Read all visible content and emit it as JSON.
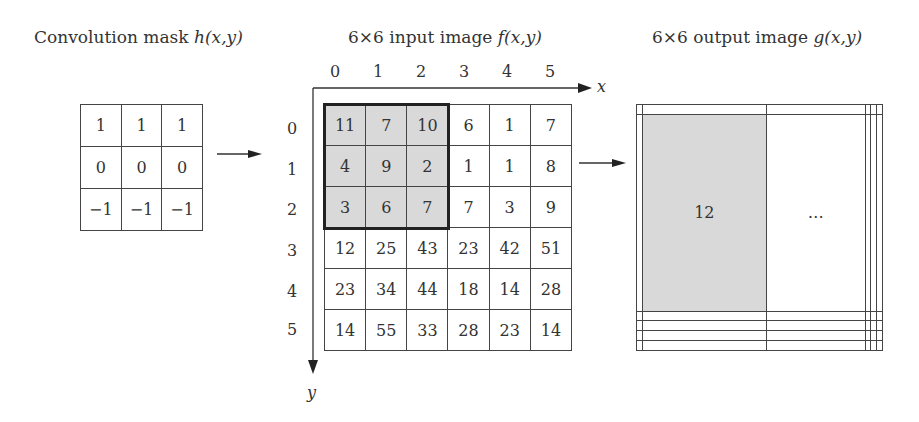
{
  "titles": {
    "mask": {
      "prefix": "Convolution mask ",
      "func": "h",
      "args": "(x,y)"
    },
    "input": {
      "prefix": "6×6 input image ",
      "func": "f",
      "args": "(x,y)"
    },
    "output": {
      "prefix": "6×6 output image ",
      "func": "g",
      "args": "(x,y)"
    }
  },
  "mask": {
    "rows": [
      [
        "1",
        "1",
        "1"
      ],
      [
        "0",
        "0",
        "0"
      ],
      [
        "−1",
        "−1",
        "−1"
      ]
    ]
  },
  "input": {
    "x_ticks": [
      "0",
      "1",
      "2",
      "3",
      "4",
      "5"
    ],
    "y_ticks": [
      "0",
      "1",
      "2",
      "3",
      "4",
      "5"
    ],
    "x_axis_label": "x",
    "y_axis_label": "y",
    "rows": [
      [
        "11",
        "7",
        "10",
        "6",
        "1",
        "7"
      ],
      [
        "4",
        "9",
        "2",
        "1",
        "1",
        "8"
      ],
      [
        "3",
        "6",
        "7",
        "7",
        "3",
        "9"
      ],
      [
        "12",
        "25",
        "43",
        "23",
        "42",
        "51"
      ],
      [
        "23",
        "34",
        "44",
        "18",
        "14",
        "28"
      ],
      [
        "14",
        "55",
        "33",
        "28",
        "23",
        "14"
      ]
    ],
    "highlight": {
      "rows": [
        0,
        1,
        2
      ],
      "cols": [
        0,
        1,
        2
      ],
      "fill": "#d9d9d9"
    }
  },
  "output": {
    "rows": [
      [
        "",
        "",
        "",
        "",
        "",
        ""
      ],
      [
        "",
        "12",
        "…",
        "",
        "",
        ""
      ],
      [
        "",
        "",
        "",
        "",
        "",
        ""
      ],
      [
        "",
        "",
        "",
        "",
        "",
        ""
      ],
      [
        "",
        "",
        "",
        "",
        "",
        ""
      ],
      [
        "",
        "",
        "",
        "",
        "",
        ""
      ]
    ],
    "highlight": {
      "row": 1,
      "col": 1,
      "fill": "#d9d9d9"
    }
  }
}
